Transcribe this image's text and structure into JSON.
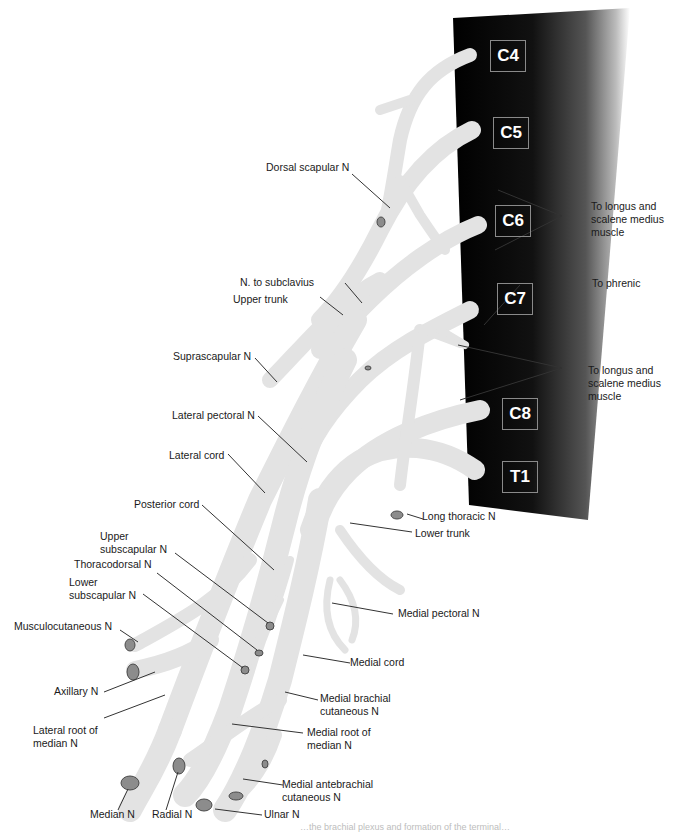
{
  "figure": {
    "title": "Brachial plexus",
    "colors": {
      "nerve_fill": "#e3e3e3",
      "nerve_stroke": "#d6d6d6",
      "cut_end_fill": "#8c8c8c",
      "cut_end_stroke": "#4a4a4a",
      "column_dark": "#000000",
      "column_light": "#ffffff",
      "leader_line": "#333333"
    },
    "caption_fragment": "…the brachial plexus and formation of the terminal…"
  },
  "vertebral_levels": [
    {
      "id": "c4",
      "label": "C4"
    },
    {
      "id": "c5",
      "label": "C5"
    },
    {
      "id": "c6",
      "label": "C6"
    },
    {
      "id": "c7",
      "label": "C7"
    },
    {
      "id": "c8",
      "label": "C8"
    },
    {
      "id": "t1",
      "label": "T1"
    }
  ],
  "labels": {
    "dorsal_scapular": "Dorsal scapular N",
    "to_longus_1": "To longus and scalene medius muscle",
    "to_phrenic": "To phrenic",
    "n_to_subclavius": "N. to subclavius",
    "upper_trunk": "Upper trunk",
    "suprascapular": "Suprascapular N",
    "to_longus_2": "To longus and scalene medius muscle",
    "lateral_pectoral": "Lateral pectoral N",
    "lateral_cord": "Lateral cord",
    "posterior_cord": "Posterior cord",
    "long_thoracic": "Long thoracic N",
    "lower_trunk": "Lower trunk",
    "upper_subscapular": "Upper subscapular N",
    "thoracodorsal": "Thoracodorsal N",
    "lower_subscapular": "Lower subscapular N",
    "medial_pectoral": "Medial pectoral N",
    "musculocutaneous": "Musculocutaneous N",
    "medial_cord": "Medial cord",
    "axillary": "Axillary N",
    "medial_brachial_cutaneous": "Medial brachial cutaneous N",
    "lateral_root_median": "Lateral root of median N",
    "medial_root_median": "Medial root of median N",
    "medial_antebrachial_cutaneous": "Medial antebrachial cutaneous N",
    "median": "Median N",
    "radial": "Radial N",
    "ulnar": "Ulnar N"
  }
}
